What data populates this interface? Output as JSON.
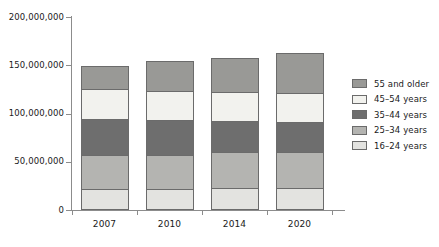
{
  "chart_data": {
    "type": "bar",
    "stacked": true,
    "title": "",
    "xlabel": "",
    "ylabel": "",
    "categories": [
      "2007",
      "2010",
      "2014",
      "2020"
    ],
    "ylim": [
      0,
      200000000
    ],
    "ytick_values": [
      0,
      50000000,
      100000000,
      150000000,
      200000000
    ],
    "ytick_labels": [
      "0",
      "50,000,000",
      "100,000,000",
      "150,000,000",
      "200,000,000"
    ],
    "grid": false,
    "legend_position": "right",
    "series": [
      {
        "name": "16–24 years",
        "color": "#e3e3e0",
        "values": [
          21700000,
          21700000,
          22800000,
          22800000
        ]
      },
      {
        "name": "25–34 years",
        "color": "#b4b4b1",
        "values": [
          35200000,
          35200000,
          37300000,
          37300000
        ]
      },
      {
        "name": "35–44 years",
        "color": "#6e6e6e",
        "values": [
          37300000,
          36200000,
          32100000,
          31100000
        ]
      },
      {
        "name": "45–54 years",
        "color": "#f2f2ee",
        "values": [
          31100000,
          30000000,
          30000000,
          30000000
        ]
      },
      {
        "name": "55 and older",
        "color": "#999996",
        "values": [
          23800000,
          31100000,
          35200000,
          41400000
        ]
      }
    ],
    "legend_order": [
      "55 and older",
      "45–54 years",
      "35–44 years",
      "25–34 years",
      "16–24 years"
    ],
    "totals": [
      149100000,
      154200000,
      157400000,
      162600000
    ]
  },
  "colors": {
    "axis": "#8c8c8c",
    "bar_outline": "#6b6b6b",
    "text": "#1a1a1a",
    "background": "#ffffff"
  }
}
